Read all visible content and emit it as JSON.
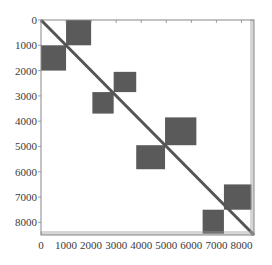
{
  "chart_data": {
    "type": "heatmap",
    "subtype": "sparsity-pattern",
    "title": "",
    "xlabel": "",
    "ylabel": "",
    "xlim": [
      0,
      8500
    ],
    "ylim": [
      8500,
      0
    ],
    "grid": false,
    "legend": null,
    "xticks": [
      0,
      1000,
      2000,
      3000,
      4000,
      5000,
      6000,
      7000,
      8000
    ],
    "yticks": [
      0,
      1000,
      2000,
      3000,
      4000,
      5000,
      6000,
      7000,
      8000
    ],
    "xtick_labels": [
      "0",
      "1000",
      "2000",
      "3000",
      "4000",
      "5000",
      "6000",
      "7000",
      "8000"
    ],
    "ytick_labels": [
      "0",
      "1000",
      "2000",
      "3000",
      "4000",
      "5000",
      "6000",
      "7000",
      "8000"
    ],
    "diagonal": {
      "from": [
        0,
        0
      ],
      "to": [
        8500,
        8500
      ],
      "color": "#555555"
    },
    "blocks": [
      {
        "name": "block-1",
        "col_start": 1000,
        "col_end": 2000,
        "row_start": 0,
        "row_end": 1000
      },
      {
        "name": "block-2",
        "col_start": 0,
        "col_end": 1000,
        "row_start": 1000,
        "row_end": 2000
      },
      {
        "name": "block-3",
        "col_start": 2900,
        "col_end": 3800,
        "row_start": 2050,
        "row_end": 2850
      },
      {
        "name": "block-4",
        "col_start": 2050,
        "col_end": 2900,
        "row_start": 2850,
        "row_end": 3700
      },
      {
        "name": "block-5",
        "col_start": 4950,
        "col_end": 6200,
        "row_start": 3850,
        "row_end": 4950
      },
      {
        "name": "block-6",
        "col_start": 3800,
        "col_end": 4950,
        "row_start": 4950,
        "row_end": 5900
      },
      {
        "name": "block-7",
        "col_start": 7300,
        "col_end": 8400,
        "row_start": 6500,
        "row_end": 7500
      },
      {
        "name": "block-8",
        "col_start": 6450,
        "col_end": 7300,
        "row_start": 7500,
        "row_end": 8450
      }
    ],
    "block_color": "#5a5a5a",
    "edge_strips": "thin sparse entries along last rows and last columns"
  }
}
